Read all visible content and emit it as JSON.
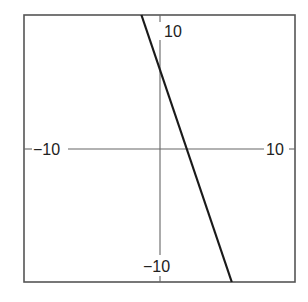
{
  "chart_data": {
    "type": "line",
    "title": "",
    "xlabel": "",
    "ylabel": "",
    "xlim": [
      -10,
      10
    ],
    "ylim": [
      -10,
      10
    ],
    "grid": false,
    "legend": null,
    "tick_labels": {
      "x_left": "−10",
      "x_right": "10",
      "y_top": "10",
      "y_bottom": "−10"
    },
    "series": [
      {
        "name": "y = -3x + 6",
        "equation": "y = -3x + 6",
        "slope": -3,
        "intercept": 6,
        "x": [
          -1.333,
          5.333
        ],
        "y": [
          10,
          -10
        ]
      }
    ],
    "annotations": {
      "y_intercept": [
        0,
        6
      ],
      "x_intercept": [
        2,
        0
      ]
    }
  },
  "colors": {
    "frame": "#555555",
    "axes": "#666666",
    "line": "#1a1a1a",
    "background": "#ffffff"
  }
}
